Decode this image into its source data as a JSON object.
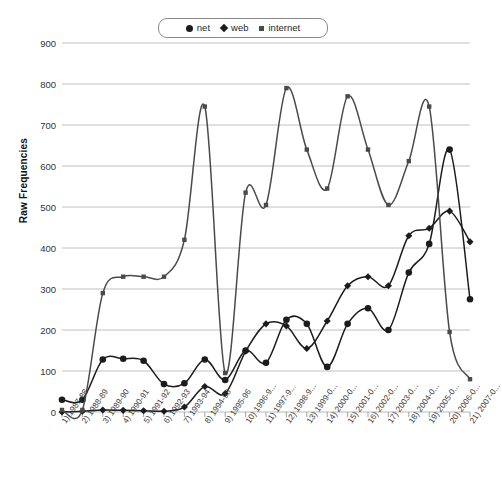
{
  "chart_data": {
    "type": "line",
    "title": "",
    "xlabel": "",
    "ylabel": "Raw Frequencies",
    "ylim": [
      0,
      900
    ],
    "yticks": [
      0,
      100,
      200,
      300,
      400,
      500,
      600,
      700,
      800,
      900
    ],
    "grid": true,
    "legend_position": "top-center",
    "categories": [
      "1) 1987-88",
      "2) 1988-89",
      "3) 1989-90",
      "4) 1990-91",
      "5) 1991-92",
      "6) 1992-93",
      "7) 1993-94",
      "8) 1994-95",
      "9) 1995-96",
      "10) 1996-9...",
      "11) 1997-9...",
      "12) 1998-9...",
      "13) 1999-0...",
      "14) 2000-0...",
      "15) 2001-0...",
      "16) 2002-0...",
      "17) 2003-0...",
      "18) 2004-0...",
      "19) 2005-0...",
      "20) 2006-0...",
      "21) 2007-0..."
    ],
    "series": [
      {
        "name": "net",
        "marker": "circle",
        "color": "#1c1c1c",
        "values": [
          30,
          30,
          128,
          130,
          125,
          68,
          70,
          128,
          78,
          150,
          120,
          225,
          215,
          110,
          215,
          253,
          200,
          340,
          410,
          640,
          275
        ]
      },
      {
        "name": "web",
        "marker": "diamond",
        "color": "#1c1c1c",
        "values": [
          0,
          2,
          5,
          4,
          3,
          2,
          12,
          62,
          45,
          148,
          215,
          210,
          155,
          222,
          308,
          330,
          308,
          430,
          448,
          490,
          415
        ]
      },
      {
        "name": "internet",
        "marker": "square",
        "color": "#4a4a4a",
        "values": [
          5,
          5,
          290,
          330,
          330,
          330,
          420,
          745,
          95,
          535,
          505,
          790,
          640,
          545,
          770,
          640,
          505,
          612,
          745,
          195,
          80
        ]
      }
    ]
  },
  "legend": {
    "items": [
      {
        "label": "net",
        "marker": "circle"
      },
      {
        "label": "web",
        "marker": "diamond"
      },
      {
        "label": "internet",
        "marker": "square"
      }
    ]
  },
  "axes": {
    "y_label": "Raw Frequencies",
    "y_ticks": [
      "900",
      "800",
      "700",
      "600",
      "500",
      "400",
      "300",
      "200",
      "100",
      "0"
    ]
  },
  "caption": ""
}
